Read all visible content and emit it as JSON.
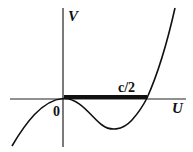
{
  "diagram": {
    "type": "potential-curve",
    "axes": {
      "y_label": "V",
      "x_label": "U",
      "origin_label": "0"
    },
    "segment_label": "c/2",
    "colors": {
      "curve": "#111111",
      "axes": "#222222",
      "segment": "#111111",
      "background": "#ffffff"
    }
  }
}
